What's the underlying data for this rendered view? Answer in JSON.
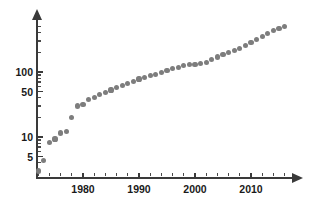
{
  "chart_data": {
    "type": "scatter",
    "title": "",
    "subtitle": "",
    "xlabel": "",
    "ylabel": "",
    "yscale": "log",
    "xscale": "linear",
    "grid": false,
    "legend": null,
    "xlim": [
      1971,
      2017
    ],
    "ylim": [
      2.5,
      600
    ],
    "xticks_major": [
      1980,
      1990,
      2000,
      2010
    ],
    "xticks_major_labels": [
      "1980",
      "1990",
      "2000",
      "2010"
    ],
    "xticks_minor": [
      1972,
      1974,
      1976,
      1978,
      1982,
      1984,
      1986,
      1988,
      1992,
      1994,
      1996,
      1998,
      2002,
      2004,
      2006,
      2008,
      2012,
      2014,
      2016
    ],
    "yticks_major": [
      5,
      10,
      50,
      100
    ],
    "yticks_major_labels": [
      "5",
      "10",
      "50",
      "100"
    ],
    "yticks_minor": [
      3,
      4,
      6,
      7,
      8,
      9,
      20,
      30,
      40,
      60,
      70,
      80,
      90,
      200,
      300,
      400,
      500
    ],
    "marker_color": "#7d7d7d",
    "marker_size_px": 5.2,
    "axis_color": "#3a3a3a",
    "background_color": "#ffffff",
    "x": [
      1972,
      1973,
      1974,
      1975,
      1976,
      1977,
      1978,
      1979,
      1980,
      1981,
      1982,
      1983,
      1984,
      1985,
      1986,
      1987,
      1988,
      1989,
      1990,
      1991,
      1992,
      1993,
      1994,
      1995,
      1996,
      1997,
      1998,
      1999,
      2000,
      2001,
      2002,
      2003,
      2004,
      2005,
      2006,
      2007,
      2008,
      2009,
      2010,
      2011,
      2012,
      2013,
      2014,
      2015,
      2016
    ],
    "y": [
      3.0,
      4.3,
      8.2,
      9.3,
      11.5,
      12.0,
      20.0,
      30.0,
      32.0,
      38.0,
      40.0,
      45.0,
      48.0,
      53.0,
      57.0,
      62.0,
      66.0,
      72.0,
      78.0,
      82.0,
      88.0,
      92.0,
      98.0,
      105.0,
      112.0,
      118.0,
      125.0,
      130.0,
      132.0,
      134.0,
      140.0,
      155.0,
      170.0,
      185.0,
      200.0,
      215.0,
      230.0,
      255.0,
      285.0,
      315.0,
      350.0,
      390.0,
      430.0,
      470.0,
      500.0
    ],
    "points": [
      {
        "x": 1972,
        "y": 3.0
      },
      {
        "x": 1973,
        "y": 4.3
      },
      {
        "x": 1974,
        "y": 8.2
      },
      {
        "x": 1975,
        "y": 9.3
      },
      {
        "x": 1976,
        "y": 11.5
      },
      {
        "x": 1977,
        "y": 12.0
      },
      {
        "x": 1978,
        "y": 20.0
      },
      {
        "x": 1979,
        "y": 30.0
      },
      {
        "x": 1980,
        "y": 32.0
      },
      {
        "x": 1981,
        "y": 38.0
      },
      {
        "x": 1982,
        "y": 40.0
      },
      {
        "x": 1983,
        "y": 45.0
      },
      {
        "x": 1984,
        "y": 48.0
      },
      {
        "x": 1985,
        "y": 53.0
      },
      {
        "x": 1986,
        "y": 57.0
      },
      {
        "x": 1987,
        "y": 62.0
      },
      {
        "x": 1988,
        "y": 66.0
      },
      {
        "x": 1989,
        "y": 72.0
      },
      {
        "x": 1990,
        "y": 78.0
      },
      {
        "x": 1991,
        "y": 82.0
      },
      {
        "x": 1992,
        "y": 88.0
      },
      {
        "x": 1993,
        "y": 92.0
      },
      {
        "x": 1994,
        "y": 98.0
      },
      {
        "x": 1995,
        "y": 105.0
      },
      {
        "x": 1996,
        "y": 112.0
      },
      {
        "x": 1997,
        "y": 118.0
      },
      {
        "x": 1998,
        "y": 125.0
      },
      {
        "x": 1999,
        "y": 130.0
      },
      {
        "x": 2000,
        "y": 132.0
      },
      {
        "x": 2001,
        "y": 134.0
      },
      {
        "x": 2002,
        "y": 140.0
      },
      {
        "x": 2003,
        "y": 155.0
      },
      {
        "x": 2004,
        "y": 170.0
      },
      {
        "x": 2005,
        "y": 185.0
      },
      {
        "x": 2006,
        "y": 200.0
      },
      {
        "x": 2007,
        "y": 215.0
      },
      {
        "x": 2008,
        "y": 230.0
      },
      {
        "x": 2009,
        "y": 255.0
      },
      {
        "x": 2010,
        "y": 285.0
      },
      {
        "x": 2011,
        "y": 315.0
      },
      {
        "x": 2012,
        "y": 350.0
      },
      {
        "x": 2013,
        "y": 390.0
      },
      {
        "x": 2014,
        "y": 430.0
      },
      {
        "x": 2015,
        "y": 470.0
      },
      {
        "x": 2016,
        "y": 500.0
      }
    ]
  },
  "geometry": {
    "plot_left_px": 36,
    "plot_right_px": 294,
    "plot_top_px": 18,
    "plot_bottom_px": 177,
    "x_at_1980_px": 83,
    "x_at_1990_px": 139,
    "x_at_2000_px": 195,
    "x_at_2010_px": 251,
    "y_at_5_px": 155,
    "y_at_10_px": 137,
    "y_at_50_px": 90,
    "y_at_100_px": 72
  }
}
